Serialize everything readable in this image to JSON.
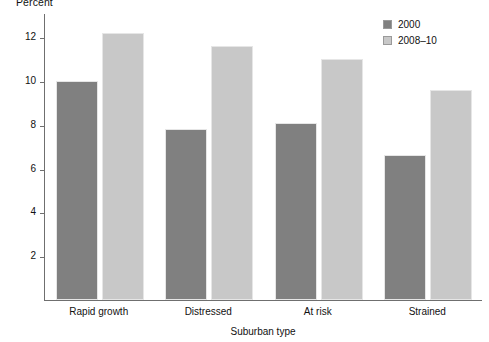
{
  "chart_data": {
    "type": "bar",
    "title": "",
    "xlabel": "Suburban type",
    "ylabel": "Percent",
    "categories": [
      "Rapid growth",
      "Distressed",
      "At risk",
      "Strained"
    ],
    "series": [
      {
        "name": "2000",
        "color": "#808080",
        "values": [
          10.0,
          7.8,
          8.1,
          6.6
        ]
      },
      {
        "name": "2008–10",
        "color": "#c8c8c8",
        "values": [
          12.2,
          11.6,
          11.0,
          9.6
        ]
      }
    ],
    "ylim": [
      0,
      13.1
    ],
    "yticks": [
      2,
      4,
      6,
      8,
      10,
      12
    ],
    "ytick_labels": [
      "2",
      "4",
      "6",
      "8",
      "10",
      "12"
    ],
    "grid": false,
    "legend_position": "top-right"
  },
  "legend": {
    "entries": [
      {
        "label": "2000",
        "color": "#808080"
      },
      {
        "label": "2008–10",
        "color": "#c8c8c8"
      }
    ]
  }
}
